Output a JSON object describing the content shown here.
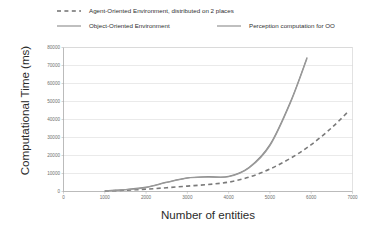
{
  "chart_data": {
    "type": "line",
    "title": "",
    "xlabel": "Number of entities",
    "ylabel": "Computational Time (ms)",
    "xlim": [
      0,
      7000
    ],
    "ylim": [
      0,
      80000
    ],
    "xticks": [
      "0",
      "1000",
      "2000",
      "3000",
      "4000",
      "5000",
      "6000",
      "7000"
    ],
    "yticks": [
      "0",
      "10000",
      "20000",
      "30000",
      "40000",
      "50000",
      "60000",
      "70000",
      "80000"
    ],
    "grid": "horizontal",
    "legend_position": "top",
    "series": [
      {
        "name": "Agent-Oriented Environment, distributed  on 2 places",
        "style": "dashed",
        "color": "#7a7a7a",
        "x": [
          1000,
          1500,
          2000,
          2500,
          3000,
          3500,
          4000,
          4500,
          5000,
          5500,
          6000,
          6500,
          6900
        ],
        "values": [
          300,
          700,
          1300,
          2100,
          3000,
          3900,
          5200,
          8000,
          12500,
          18500,
          26000,
          35500,
          44500
        ]
      },
      {
        "name": "Object-Oriented Environment",
        "style": "solid",
        "color": "#8a8a8a",
        "x": [
          1000,
          1500,
          2000,
          2500,
          3000,
          3500,
          4000,
          4500,
          5000,
          5500,
          5900
        ],
        "values": [
          400,
          1100,
          2400,
          5200,
          7600,
          8200,
          8400,
          13500,
          26000,
          50000,
          74500
        ]
      },
      {
        "name": "Perception computation for OO",
        "style": "solid",
        "color": "#9a9a9a",
        "x": [
          1000,
          1500,
          2000,
          2500,
          3000,
          3500,
          4000,
          4500,
          5000,
          5500,
          5900
        ],
        "values": [
          350,
          1000,
          2200,
          5000,
          7400,
          8000,
          8200,
          13200,
          25500,
          49500,
          74000
        ]
      }
    ]
  },
  "legend": {
    "agent": {
      "label": "Agent-Oriented Environment, distributed  on 2 places",
      "style": "dashed"
    },
    "object": {
      "label": "Object-Oriented Environment",
      "style": "solid"
    },
    "perception": {
      "label": "Perception computation for OO",
      "style": "solid"
    }
  },
  "axes": {
    "x_title": "Number of entities",
    "y_title": "Computational Time (ms)"
  },
  "colors": {
    "line_gray": "#8a8a8a",
    "grid": "#d9d9d9",
    "axis": "#b0b0b0",
    "text": "#2b2b2b"
  }
}
